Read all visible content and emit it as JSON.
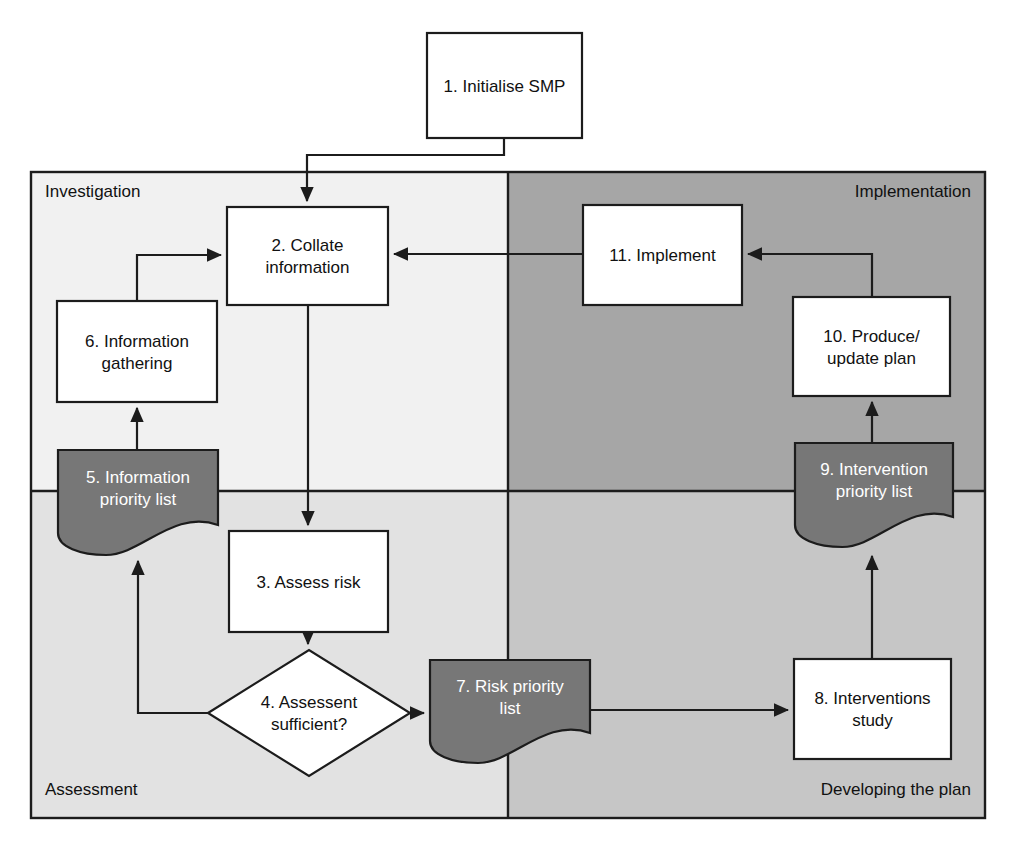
{
  "diagram": {
    "quadrants": [
      {
        "key": "investigation",
        "label": "Investigation",
        "fill": "#f1f1f1",
        "x": 31,
        "y": 172,
        "w": 477,
        "h": 319,
        "label_x": 45,
        "label_y": 197,
        "anchor": "start"
      },
      {
        "key": "implementation",
        "label": "Implementation",
        "fill": "#a6a6a6",
        "x": 508,
        "y": 172,
        "w": 477,
        "h": 319,
        "label_x": 971,
        "label_y": 197,
        "anchor": "end"
      },
      {
        "key": "assessment",
        "label": "Assessment",
        "fill": "#e2e2e2",
        "x": 31,
        "y": 491,
        "w": 477,
        "h": 327,
        "label_x": 45,
        "label_y": 795,
        "anchor": "start"
      },
      {
        "key": "developing_the_plan",
        "label": "Developing the plan",
        "fill": "#c6c6c6",
        "x": 508,
        "y": 491,
        "w": 477,
        "h": 327,
        "label_x": 971,
        "label_y": 795,
        "anchor": "end"
      }
    ],
    "nodes": [
      {
        "id": "n1",
        "shape": "box",
        "number": "1.",
        "lines": [
          "1. Initialise SMP"
        ],
        "x": 427,
        "y": 33,
        "w": 155,
        "h": 105,
        "fill": "white",
        "text_fill": "dark"
      },
      {
        "id": "n2",
        "shape": "box",
        "number": "2.",
        "lines": [
          "2. Collate",
          "information"
        ],
        "x": 227,
        "y": 207,
        "w": 161,
        "h": 98,
        "fill": "white",
        "text_fill": "dark"
      },
      {
        "id": "n3",
        "shape": "box",
        "number": "3.",
        "lines": [
          "3. Assess risk"
        ],
        "x": 229,
        "y": 531,
        "w": 159,
        "h": 101,
        "fill": "white",
        "text_fill": "dark"
      },
      {
        "id": "n4",
        "shape": "diamond",
        "number": "4.",
        "lines": [
          "4. Assessent",
          "sufficient?"
        ],
        "x": 208,
        "y": 650,
        "w": 202,
        "h": 126,
        "fill": "white",
        "text_fill": "dark"
      },
      {
        "id": "n5",
        "shape": "document",
        "number": "5.",
        "lines": [
          "5. Information",
          "priority list"
        ],
        "x": 58,
        "y": 450,
        "w": 160,
        "h": 105,
        "fill": "dark",
        "text_fill": "light"
      },
      {
        "id": "n6",
        "shape": "box",
        "number": "6.",
        "lines": [
          "6. Information",
          "gathering"
        ],
        "x": 57,
        "y": 301,
        "w": 160,
        "h": 101,
        "fill": "white",
        "text_fill": "dark"
      },
      {
        "id": "n7",
        "shape": "document",
        "number": "7.",
        "lines": [
          "7. Risk priority",
          "list"
        ],
        "x": 430,
        "y": 660,
        "w": 160,
        "h": 103,
        "fill": "dark",
        "text_fill": "light"
      },
      {
        "id": "n8",
        "shape": "box",
        "number": "8.",
        "lines": [
          "8. Interventions",
          "study"
        ],
        "x": 794,
        "y": 659,
        "w": 157,
        "h": 100,
        "fill": "white",
        "text_fill": "dark"
      },
      {
        "id": "n9",
        "shape": "document",
        "number": "9.",
        "lines": [
          "9. Intervention",
          "priority list"
        ],
        "x": 795,
        "y": 443,
        "w": 158,
        "h": 104,
        "fill": "dark",
        "text_fill": "light"
      },
      {
        "id": "n10",
        "shape": "box",
        "number": "10.",
        "lines": [
          "10. Produce/",
          "update plan"
        ],
        "x": 793,
        "y": 297,
        "w": 157,
        "h": 99,
        "fill": "white",
        "text_fill": "dark"
      },
      {
        "id": "n11",
        "shape": "box",
        "number": "11.",
        "lines": [
          "11. Implement"
        ],
        "x": 583,
        "y": 205,
        "w": 159,
        "h": 100,
        "fill": "white",
        "text_fill": "dark"
      }
    ],
    "connectors": [
      {
        "id": "c1",
        "from": "n1",
        "to": "n2",
        "label": "initialise-to-collate"
      },
      {
        "id": "c2",
        "from": "n2",
        "to": "n3",
        "label": "collate-to-assess-risk"
      },
      {
        "id": "c3",
        "from": "n3",
        "to": "n4",
        "label": "assess-risk-to-decision"
      },
      {
        "id": "c4",
        "from": "n4",
        "to": "n5",
        "label": "decision-no-to-information-priority-list"
      },
      {
        "id": "c5",
        "from": "n5",
        "to": "n6",
        "label": "information-priority-list-to-gathering"
      },
      {
        "id": "c6",
        "from": "n6",
        "to": "n2",
        "label": "gathering-to-collate"
      },
      {
        "id": "c7",
        "from": "n4",
        "to": "n7",
        "label": "decision-yes-to-risk-priority-list"
      },
      {
        "id": "c8",
        "from": "n7",
        "to": "n8",
        "label": "risk-priority-list-to-interventions-study"
      },
      {
        "id": "c9",
        "from": "n8",
        "to": "n9",
        "label": "interventions-study-to-intervention-priority-list"
      },
      {
        "id": "c10",
        "from": "n9",
        "to": "n10",
        "label": "intervention-priority-list-to-produce-plan"
      },
      {
        "id": "c11",
        "from": "n10",
        "to": "n11",
        "label": "produce-plan-to-implement"
      },
      {
        "id": "c12",
        "from": "n11",
        "to": "n2",
        "label": "implement-to-collate"
      }
    ],
    "colors": {
      "document_fill": "#777777",
      "box_fill": "#ffffff",
      "stroke": "#1c1c1c",
      "investigation_fill": "#f1f1f1",
      "implementation_fill": "#a6a6a6",
      "assessment_fill": "#e2e2e2",
      "developing_fill": "#c6c6c6"
    }
  }
}
